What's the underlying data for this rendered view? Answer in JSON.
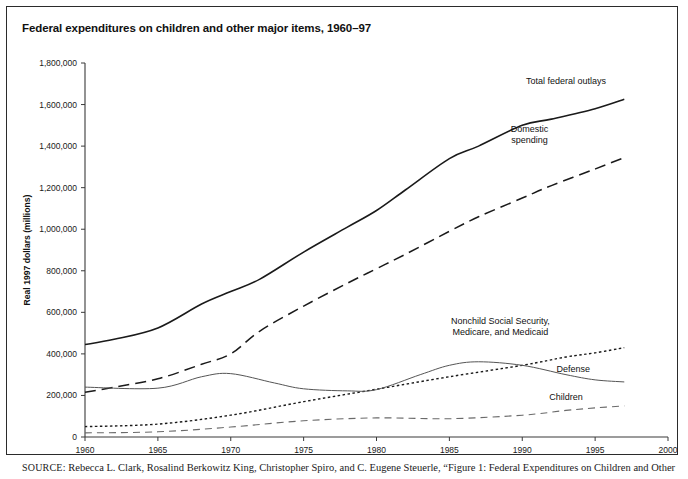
{
  "figure": {
    "title": "Federal expenditures on children and other major items, 1960–97",
    "source_label": "SOURCE:",
    "source_text": " Rebecca L. Clark, Rosalind Berkowitz King, Christopher Spiro, and C. Eugene Steuerle, “Figure 1: Federal Expenditures on Children and Other"
  },
  "chart_data": {
    "type": "line",
    "title": "Federal expenditures on children and other major items, 1960–97",
    "xlabel": "",
    "ylabel": "Real 1997 dollars (millions)",
    "xlim": [
      1960,
      2000
    ],
    "ylim": [
      0,
      1800000
    ],
    "xticks": [
      1960,
      1965,
      1970,
      1975,
      1980,
      1985,
      1990,
      1995,
      2000
    ],
    "xtick_labels": [
      "1960",
      "1965",
      "1970",
      "1975",
      "1980",
      "1985",
      "1990",
      "1995",
      "2000"
    ],
    "yticks": [
      0,
      200000,
      400000,
      600000,
      800000,
      1000000,
      1200000,
      1400000,
      1600000,
      1800000
    ],
    "ytick_labels": [
      "0",
      "200,000",
      "400,000",
      "600,000",
      "800,000",
      "1,000,000",
      "1,200,000",
      "1,400,000",
      "1,600,000",
      "1,800,000"
    ],
    "grid": false,
    "legend_position": "inline-right-labels",
    "series": [
      {
        "name": "Total federal outlays",
        "label": "Total federal outlays",
        "style": "solid",
        "color": "#1a1a1a",
        "width": 1.6,
        "label_x": 1993.0,
        "label_y": 1700000,
        "x": [
          1960,
          1962,
          1965,
          1968,
          1970,
          1972,
          1975,
          1978,
          1980,
          1982,
          1985,
          1987,
          1990,
          1992,
          1995,
          1997
        ],
        "y": [
          445000,
          470000,
          525000,
          640000,
          700000,
          760000,
          890000,
          1010000,
          1090000,
          1190000,
          1340000,
          1400000,
          1500000,
          1530000,
          1580000,
          1625000
        ]
      },
      {
        "name": "Domestic spending",
        "label": "Domestic spending",
        "style": "dashed",
        "color": "#1a1a1a",
        "width": 1.5,
        "label_x": 1990.5,
        "label_y": 1470000,
        "x": [
          1960,
          1962,
          1965,
          1968,
          1970,
          1972,
          1975,
          1978,
          1980,
          1982,
          1985,
          1987,
          1990,
          1992,
          1995,
          1997
        ],
        "y": [
          215000,
          240000,
          280000,
          350000,
          400000,
          510000,
          630000,
          740000,
          810000,
          880000,
          990000,
          1060000,
          1150000,
          1210000,
          1290000,
          1345000
        ]
      },
      {
        "name": "Nonchild Social Security, Medicare, and Medicaid",
        "label": "Nonchild Social Security, Medicare, and Medicaid",
        "style": "dotted",
        "color": "#1a1a1a",
        "width": 1.4,
        "label_x": 1988.5,
        "label_y": 545000,
        "x": [
          1960,
          1965,
          1970,
          1975,
          1980,
          1985,
          1990,
          1993,
          1995,
          1997
        ],
        "y": [
          50000,
          62000,
          105000,
          170000,
          230000,
          290000,
          345000,
          385000,
          405000,
          430000
        ]
      },
      {
        "name": "Defense",
        "label": "Defense",
        "style": "solid-thin",
        "color": "#555555",
        "width": 1.0,
        "label_x": 1993.5,
        "label_y": 315000,
        "x": [
          1960,
          1965,
          1968,
          1970,
          1973,
          1975,
          1978,
          1980,
          1983,
          1985,
          1987,
          1990,
          1993,
          1995,
          1997
        ],
        "y": [
          240000,
          235000,
          290000,
          305000,
          260000,
          232000,
          222000,
          228000,
          300000,
          345000,
          362000,
          345000,
          300000,
          275000,
          265000
        ]
      },
      {
        "name": "Children",
        "label": "Children",
        "style": "dashed-thin",
        "color": "#6a6a6a",
        "width": 1.1,
        "label_x": 1993.0,
        "label_y": 180000,
        "x": [
          1960,
          1965,
          1970,
          1975,
          1980,
          1985,
          1990,
          1993,
          1995,
          1997
        ],
        "y": [
          20000,
          25000,
          48000,
          78000,
          92000,
          88000,
          105000,
          128000,
          140000,
          150000
        ]
      }
    ]
  }
}
